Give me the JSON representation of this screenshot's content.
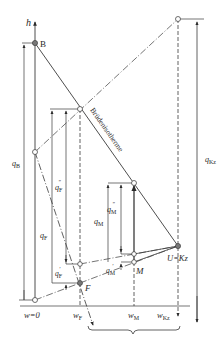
{
  "diagram": {
    "type": "h-w enthalpy-concentration diagram (mixing / Brüdenisotherme construction)",
    "axes": {
      "vertical": {
        "label": "h"
      },
      "horizontal_ticks": {
        "origin": "w=0",
        "wF": {
          "main": "w",
          "sub": "F"
        },
        "wM": {
          "main": "w",
          "sub": "M"
        },
        "wKz": {
          "main": "w",
          "sub": "Kz"
        }
      }
    },
    "points": {
      "B": "B",
      "F": "F",
      "M": "M",
      "U": "U=Kz"
    },
    "line_labels": {
      "isotherm": "Brüdenisotherme"
    },
    "quantities": {
      "qB": {
        "main": "q",
        "sub": "B"
      },
      "qF": {
        "main": "q",
        "sub": "F"
      },
      "qF2": {
        "main": "q",
        "sub": "F",
        "prime": "″"
      },
      "qF1": {
        "main": "q",
        "sub": "F",
        "prime": "′"
      },
      "qM": {
        "main": "q",
        "sub": "M"
      },
      "qM2": {
        "main": "q",
        "sub": "M",
        "prime": "″"
      },
      "qM1": {
        "main": "q",
        "sub": "M",
        "prime": "′"
      },
      "qKz": {
        "main": "q",
        "sub": "Kz"
      }
    },
    "colors": {
      "ink": "#3a3a3a",
      "background": "#ffffff"
    }
  }
}
